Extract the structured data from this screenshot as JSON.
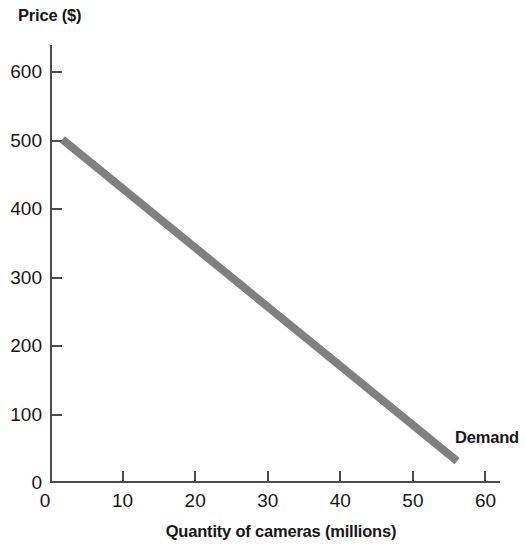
{
  "chart_data": {
    "type": "line",
    "title": "",
    "xlabel": "Quantity of cameras (millions)",
    "ylabel": "Price ($)",
    "xlim": [
      0,
      62
    ],
    "ylim": [
      0,
      640
    ],
    "xticks": [
      0,
      10,
      20,
      30,
      40,
      50,
      60
    ],
    "yticks": [
      0,
      100,
      200,
      300,
      400,
      500,
      600
    ],
    "xtick_labels": [
      "0",
      "10",
      "20",
      "30",
      "40",
      "50",
      "60"
    ],
    "ytick_labels": [
      "0",
      "100",
      "200",
      "300",
      "400",
      "500",
      "600"
    ],
    "grid": false,
    "legend": "none",
    "series": [
      {
        "name": "Demand",
        "color": "#808080",
        "line_width": 8,
        "x": [
          1.7,
          56.1
        ],
        "y": [
          502,
          32
        ],
        "points": [
          {
            "x": 1.7,
            "y": 502
          },
          {
            "x": 56.1,
            "y": 32
          }
        ],
        "annotation": "Demand"
      }
    ],
    "annotations": [
      {
        "text": "Demand",
        "x": 56.5,
        "y": 80
      }
    ]
  },
  "labels": {
    "y_axis_title": "Price ($)",
    "x_axis_title": "Quantity of cameras (millions)",
    "demand_label": "Demand"
  },
  "colors": {
    "background": "#ffffff",
    "axis": "#4b4b4b",
    "text": "#161616",
    "demand_line": "#808080"
  }
}
